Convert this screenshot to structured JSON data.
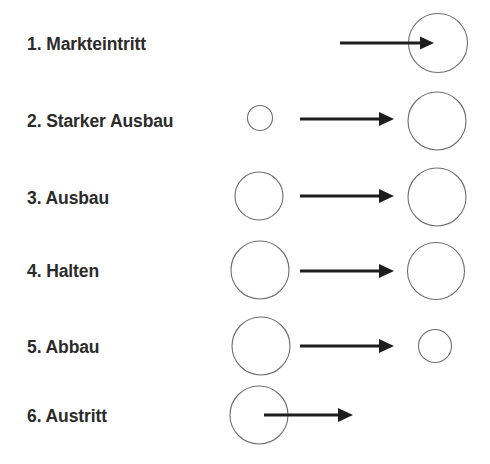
{
  "figure": {
    "background_color": "#ffffff",
    "text_color": "#2b2b2b",
    "circle_stroke_color": "#6e6e6e",
    "arrow_color": "#1d1d1d",
    "width": 490,
    "height": 464
  },
  "rows": [
    {
      "index": "1",
      "label": "1. Markteintritt",
      "label_x": 27,
      "label_y": 50,
      "from_circle": null,
      "to_circle": {
        "cx": 438,
        "cy": 43,
        "r": 29.5
      },
      "arrow": {
        "x1": 340,
        "x2": 434,
        "y": 43
      },
      "meaning": "kein Ausgangskreis, Pfeil fuehrt in den grossen Zielkreis hinein"
    },
    {
      "index": "2",
      "label": "2. Starker Ausbau",
      "label_x": 27,
      "label_y": 127,
      "from_circle": {
        "cx": 260,
        "cy": 118,
        "r": 12.5
      },
      "to_circle": {
        "cx": 437,
        "cy": 121,
        "r": 29
      },
      "arrow": {
        "x1": 300,
        "x2": 394,
        "y": 119
      },
      "meaning": "kleiner Kreis wird zu grossem Kreis"
    },
    {
      "index": "3",
      "label": "3. Ausbau",
      "label_x": 27,
      "label_y": 204,
      "from_circle": {
        "cx": 259,
        "cy": 196,
        "r": 24
      },
      "to_circle": {
        "cx": 437,
        "cy": 197,
        "r": 29
      },
      "arrow": {
        "x1": 300,
        "x2": 394,
        "y": 196
      },
      "meaning": "mittlerer Kreis wird zu grossem Kreis"
    },
    {
      "index": "4",
      "label": "4. Halten",
      "label_x": 27,
      "label_y": 277,
      "from_circle": {
        "cx": 260,
        "cy": 270,
        "r": 29
      },
      "to_circle": {
        "cx": 436,
        "cy": 271,
        "r": 28.5
      },
      "arrow": {
        "x1": 300,
        "x2": 394,
        "y": 271
      },
      "meaning": "grosser Kreis bleibt gleich gross"
    },
    {
      "index": "5",
      "label": "5. Abbau",
      "label_x": 27,
      "label_y": 353,
      "from_circle": {
        "cx": 261,
        "cy": 346,
        "r": 29
      },
      "to_circle": {
        "cx": 435,
        "cy": 346,
        "r": 16.5
      },
      "arrow": {
        "x1": 300,
        "x2": 394,
        "y": 346
      },
      "meaning": "grosser Kreis wird zu kleinem Kreis"
    },
    {
      "index": "6",
      "label": "6. Austritt",
      "label_x": 27,
      "label_y": 422,
      "from_circle": {
        "cx": 259,
        "cy": 415,
        "r": 29
      },
      "to_circle": null,
      "arrow": {
        "x1": 264,
        "x2": 353,
        "y": 415
      },
      "meaning": "Pfeil startet im Kreis und fuehrt hinaus, kein Zielkreis"
    }
  ]
}
